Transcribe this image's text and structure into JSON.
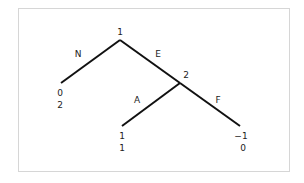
{
  "diagram": {
    "type": "extensive-form game tree",
    "nodes": [
      {
        "id": "root",
        "player_label": "1",
        "x": 120,
        "y": 40,
        "label_x": 120,
        "label_y": 32
      },
      {
        "id": "node2",
        "player_label": "2",
        "x": 180,
        "y": 83,
        "label_x": 186,
        "label_y": 75
      }
    ],
    "edges": [
      {
        "id": "edge-N",
        "action": "N",
        "from": [
          120,
          40
        ],
        "to": [
          61,
          83
        ],
        "label_x": 78,
        "label_y": 54
      },
      {
        "id": "edge-E",
        "action": "E",
        "from": [
          120,
          40
        ],
        "to": [
          180,
          83
        ],
        "label_x": 158,
        "label_y": 54
      },
      {
        "id": "edge-A",
        "action": "A",
        "from": [
          180,
          83
        ],
        "to": [
          122,
          126
        ],
        "label_x": 137,
        "label_y": 100
      },
      {
        "id": "edge-F",
        "action": "F",
        "from": [
          180,
          83
        ],
        "to": [
          240,
          126
        ],
        "label_x": 218,
        "label_y": 100
      }
    ],
    "terminals": [
      {
        "id": "terminal-N",
        "payoff_1": "0",
        "payoff_2": "2",
        "x": 60,
        "y1": 93,
        "y2": 105
      },
      {
        "id": "terminal-A",
        "payoff_1": "1",
        "payoff_2": "1",
        "x": 122,
        "y1": 136,
        "y2": 148
      },
      {
        "id": "terminal-F",
        "payoff_1": "−1",
        "payoff_2": "0",
        "x": 242,
        "y1": 136,
        "y2": 148
      }
    ],
    "colors": {
      "line": "#111111",
      "text": "#222222",
      "frame_border": "#d6d6d6",
      "background": "#ffffff"
    }
  }
}
